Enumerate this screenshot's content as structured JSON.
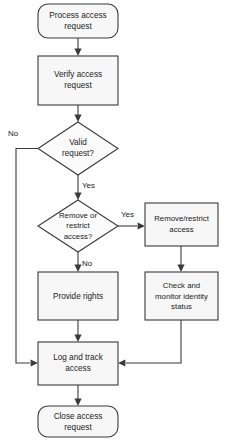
{
  "diagram": {
    "colors": {
      "node_fill": "#f7f7f7",
      "node_stroke": "#3a3a3a",
      "text": "#1b1b1b",
      "background": "#ffffff"
    },
    "nodes": [
      {
        "id": "process-access-request",
        "type": "terminal",
        "lines": [
          "Process access",
          "request"
        ]
      },
      {
        "id": "verify-access-request",
        "type": "process",
        "lines": [
          "Verify access",
          "request"
        ]
      },
      {
        "id": "valid-request",
        "type": "decision",
        "lines": [
          "Valid",
          "request?"
        ]
      },
      {
        "id": "remove-or-restrict-access",
        "type": "decision",
        "lines": [
          "Remove or",
          "restrict",
          "access?"
        ]
      },
      {
        "id": "remove-restrict-access",
        "type": "process",
        "lines": [
          "Remove/restrict",
          "access"
        ]
      },
      {
        "id": "provide-rights",
        "type": "process",
        "lines": [
          "Provide rights"
        ]
      },
      {
        "id": "check-and-monitor-identity-status",
        "type": "process",
        "lines": [
          "Check and",
          "monitor identity",
          "status"
        ]
      },
      {
        "id": "log-and-track-access",
        "type": "process",
        "lines": [
          "Log and track",
          "access"
        ]
      },
      {
        "id": "close-access-request",
        "type": "terminal",
        "lines": [
          "Close access",
          "request"
        ]
      }
    ],
    "edge_labels": {
      "valid_no": "No",
      "valid_yes": "Yes",
      "remove_yes": "Yes",
      "remove_no": "No"
    }
  }
}
